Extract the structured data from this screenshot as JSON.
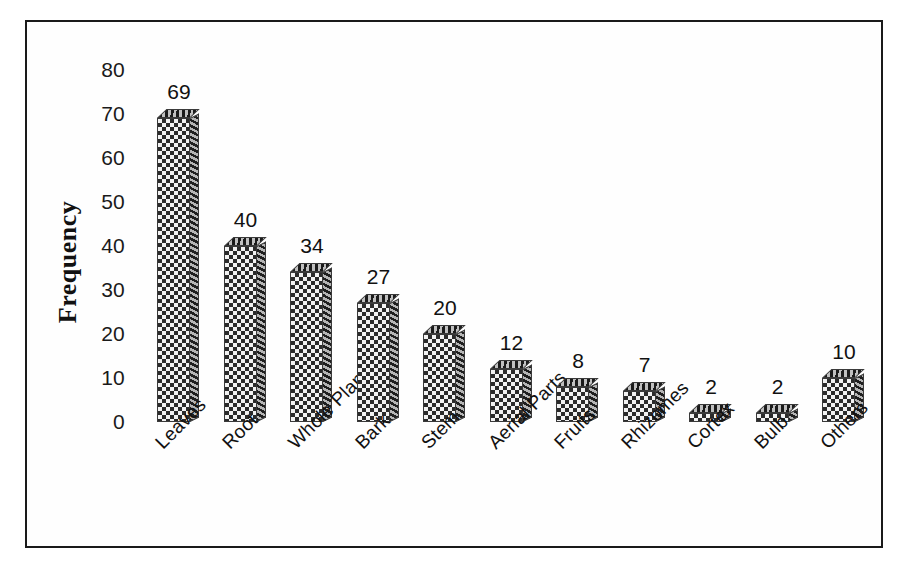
{
  "figure": {
    "background_color": "#ffffff",
    "frame_color": "#1a1a1a",
    "bar_fill_color": "#2b2b2b",
    "bar_shade_color": "#7a7a7a",
    "text_color": "#111111"
  },
  "chart_data": {
    "type": "bar",
    "title": "",
    "xlabel": "",
    "ylabel": "Frequency",
    "ylim": [
      0,
      80
    ],
    "yticks": [
      0,
      10,
      20,
      30,
      40,
      50,
      60,
      70,
      80
    ],
    "grid": false,
    "legend": false,
    "data_labels": true,
    "categories": [
      "Leaves",
      "Root",
      "Whole Plant",
      "Bark",
      "Stem",
      "Aerial Parts",
      "Fruits",
      "Rhizomes",
      "Cortex",
      "Bulb",
      "Others"
    ],
    "values": [
      69,
      40,
      34,
      27,
      20,
      12,
      8,
      7,
      2,
      2,
      10
    ]
  }
}
